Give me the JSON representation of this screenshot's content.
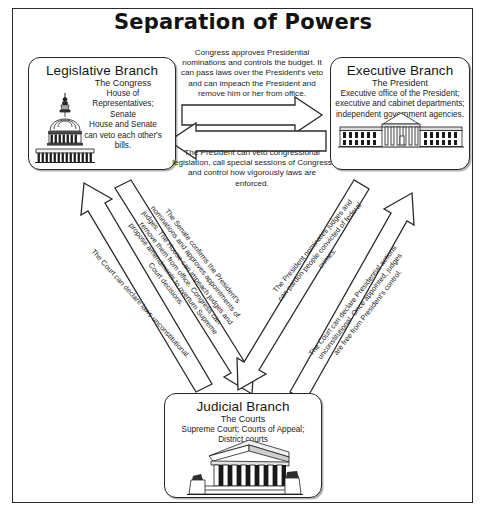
{
  "title": "Separation of Powers",
  "boxes": {
    "legislative": {
      "title": "Legislative Branch",
      "lead": "The Congress",
      "line2": "House of Representatives;",
      "line3": "Senate",
      "line4": "House and Senate",
      "line5": "can veto each other's bills.",
      "icon": "capitol-building-icon"
    },
    "executive": {
      "title": "Executive Branch",
      "lead": "The President",
      "line2": "Executive office of the President;",
      "line3": "executive and cabinet departments;",
      "line4": "independent government agencies.",
      "icon": "white-house-icon"
    },
    "judicial": {
      "title": "Judicial Branch",
      "lead": "The Courts",
      "line2": "Supreme Court; Courts of Appeal;",
      "line3": "District courts",
      "icon": "supreme-court-building-icon"
    }
  },
  "notes": {
    "congress_to_president": "Congress approves Presidential nominations and controls the budget. It can pass laws over the President's veto and can impeach the President and remove him or her from office.",
    "president_to_congress": "The President can veto congressional legislation, call special sessions of Congress and control how vigorously laws are enforced."
  },
  "diagonals": {
    "court_to_congress": "The Court can declare laws unconstitutional.",
    "congress_to_court": "The Senate confirms the President's nominations and approves appointments of judges. The House can impeach judges and remove them from office. Congress can propose amendments to overturn Supreme Court decisions.",
    "president_to_court": "The President nominates judges and can pardon people convicted of federal crimes.",
    "court_to_president": "The Court can declare Presidential actions unconstitutional. Once appointed, judges are free from President's control."
  },
  "colors": {
    "ink": "#1a1a1a",
    "frame": "#2b2b2b",
    "arrow_stroke": "#2a2a2a",
    "arrow_fill": "#ffffff",
    "page_bg": "#ffffff"
  }
}
